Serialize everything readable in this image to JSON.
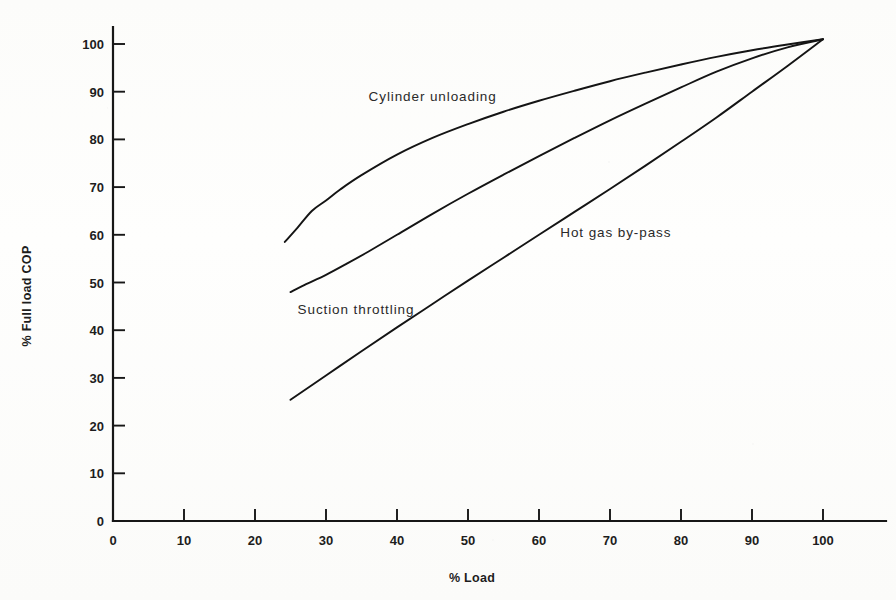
{
  "chart_data": {
    "type": "line",
    "title": "",
    "xlabel": "% Load",
    "ylabel": "% Full load COP",
    "xlim": [
      0,
      107
    ],
    "ylim": [
      0,
      107
    ],
    "xticks": [
      0,
      10,
      20,
      30,
      40,
      50,
      60,
      70,
      80,
      90,
      100
    ],
    "yticks": [
      0,
      10,
      20,
      30,
      40,
      50,
      60,
      70,
      80,
      90,
      100
    ],
    "xtick_labels": [
      "0",
      "10",
      "20",
      "30",
      "40",
      "50",
      "60",
      "70",
      "80",
      "90",
      "100"
    ],
    "ytick_labels": [
      "0",
      "10",
      "20",
      "30",
      "40",
      "50",
      "60",
      "70",
      "80",
      "90",
      "100"
    ],
    "grid": false,
    "legend_position": "inline-annotations",
    "line_color": "#141414",
    "background_color": "#fdfdfc",
    "series": [
      {
        "name": "Cylinder unloading",
        "label_x": 36,
        "label_y": 88,
        "x": [
          24.2,
          26,
          28,
          30,
          32,
          35,
          40,
          45,
          50,
          55,
          60,
          65,
          70,
          75,
          80,
          85,
          90,
          95,
          100
        ],
        "y": [
          58.5,
          61.5,
          65.0,
          67.2,
          69.5,
          72.5,
          76.8,
          80.3,
          83.2,
          85.8,
          88.1,
          90.2,
          92.2,
          94.0,
          95.7,
          97.3,
          98.7,
          99.9,
          101.0
        ]
      },
      {
        "name": "Suction throttling",
        "label_x": 26,
        "label_y": 43.5,
        "x": [
          25.0,
          27,
          30,
          33,
          36,
          40,
          45,
          50,
          55,
          60,
          65,
          70,
          75,
          80,
          85,
          90,
          95,
          100
        ],
        "y": [
          48.0,
          49.5,
          51.6,
          54.0,
          56.5,
          60.0,
          64.4,
          68.6,
          72.6,
          76.5,
          80.3,
          84.0,
          87.5,
          90.9,
          94.2,
          97.0,
          99.3,
          101.0
        ]
      },
      {
        "name": "Hot gas by-pass",
        "label_x": 63,
        "label_y": 59.5,
        "x": [
          25.0,
          30,
          35,
          40,
          45,
          50,
          55,
          60,
          65,
          70,
          75,
          80,
          85,
          90,
          95,
          100
        ],
        "y": [
          25.4,
          30.5,
          35.6,
          40.6,
          45.5,
          50.4,
          55.2,
          60.0,
          64.8,
          69.6,
          74.5,
          79.5,
          84.6,
          90.0,
          95.4,
          101.0
        ]
      }
    ]
  },
  "axes": {
    "x_axis_name": "x-axis",
    "y_axis_name": "y-axis"
  }
}
